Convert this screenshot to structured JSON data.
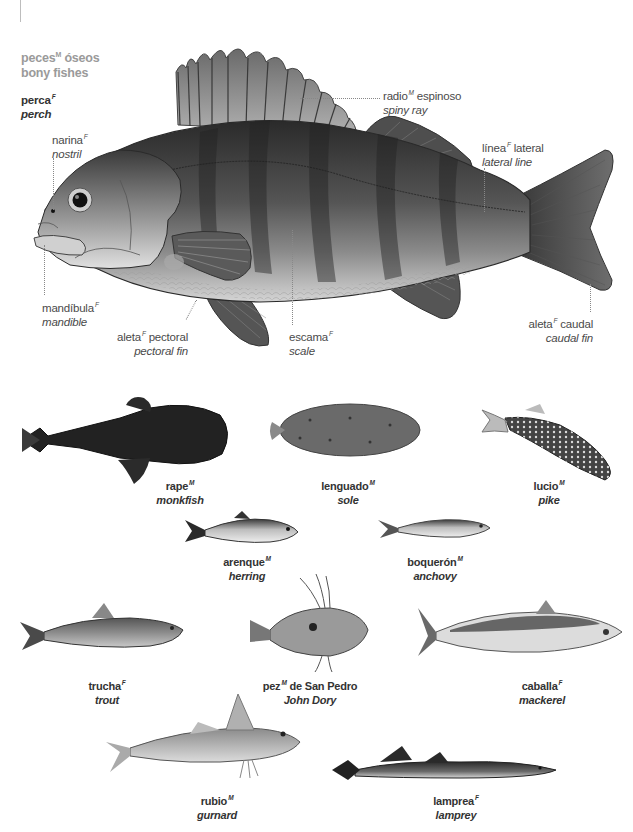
{
  "header": {
    "title_es": "peces",
    "title_es_gender": "M",
    "title_es_rest": "óseos",
    "title_en": "bony fishes"
  },
  "main_fish": {
    "name_es": "perca",
    "name_es_gender": "F",
    "name_en": "perch",
    "parts": [
      {
        "es": "narina",
        "gender": "F",
        "en": "nostril"
      },
      {
        "es": "radio",
        "gender": "M",
        "es_rest": "espinoso",
        "en": "spiny ray"
      },
      {
        "es": "línea",
        "gender": "F",
        "es_rest": "lateral",
        "en": "lateral line"
      },
      {
        "es": "mandíbula",
        "gender": "F",
        "en": "mandible"
      },
      {
        "es": "aleta",
        "gender": "F",
        "es_rest": "pectoral",
        "en": "pectoral fin"
      },
      {
        "es": "escama",
        "gender": "F",
        "en": "scale"
      },
      {
        "es": "aleta",
        "gender": "F",
        "es_rest": "caudal",
        "en": "caudal fin"
      }
    ]
  },
  "species": [
    {
      "es": "rape",
      "gender": "M",
      "en": "monkfish"
    },
    {
      "es": "lenguado",
      "gender": "M",
      "en": "sole"
    },
    {
      "es": "lucio",
      "gender": "M",
      "en": "pike"
    },
    {
      "es": "arenque",
      "gender": "M",
      "en": "herring"
    },
    {
      "es": "boquerón",
      "gender": "M",
      "en": "anchovy"
    },
    {
      "es": "trucha",
      "gender": "F",
      "en": "trout"
    },
    {
      "es": "pez",
      "gender": "M",
      "es_rest": "de San Pedro",
      "en": "John Dory"
    },
    {
      "es": "caballa",
      "gender": "F",
      "en": "mackerel"
    },
    {
      "es": "rubio",
      "gender": "M",
      "en": "gurnard"
    },
    {
      "es": "lamprea",
      "gender": "F",
      "en": "lamprey"
    }
  ],
  "colors": {
    "title": "#9a9a9a",
    "label": "#4a4a4a",
    "fish_dark": "#3b3b3b",
    "fish_light": "#d8d8d8"
  }
}
